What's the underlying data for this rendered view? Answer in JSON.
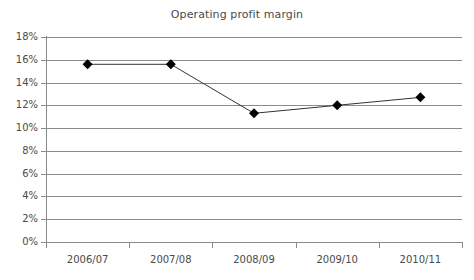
{
  "chart_data": {
    "type": "line",
    "title": "Operating profit margin",
    "xlabel": "",
    "ylabel": "",
    "categories": [
      "2006/07",
      "2007/08",
      "2008/09",
      "2009/10",
      "2010/11"
    ],
    "values": [
      15.6,
      15.6,
      11.3,
      12.0,
      12.7
    ],
    "series": [
      {
        "name": "Operating profit margin",
        "values": [
          15.6,
          15.6,
          11.3,
          12.0,
          12.7
        ]
      }
    ],
    "ylim": [
      0,
      18
    ],
    "ytick_step": 2,
    "ytick_labels": [
      "0%",
      "2%",
      "4%",
      "6%",
      "8%",
      "10%",
      "12%",
      "14%",
      "16%",
      "18%"
    ],
    "ytick_values": [
      0,
      2,
      4,
      6,
      8,
      10,
      12,
      14,
      16,
      18
    ],
    "grid": true,
    "grid_axis": "y",
    "legend": false,
    "legend_position": "none",
    "marker": "diamond",
    "marker_color": "#000000",
    "line_color": "#333333",
    "grid_color": "#8a8a8a",
    "axis_color": "#8a8a8a",
    "text_color": "#4a4a4a",
    "background": "#ffffff"
  }
}
